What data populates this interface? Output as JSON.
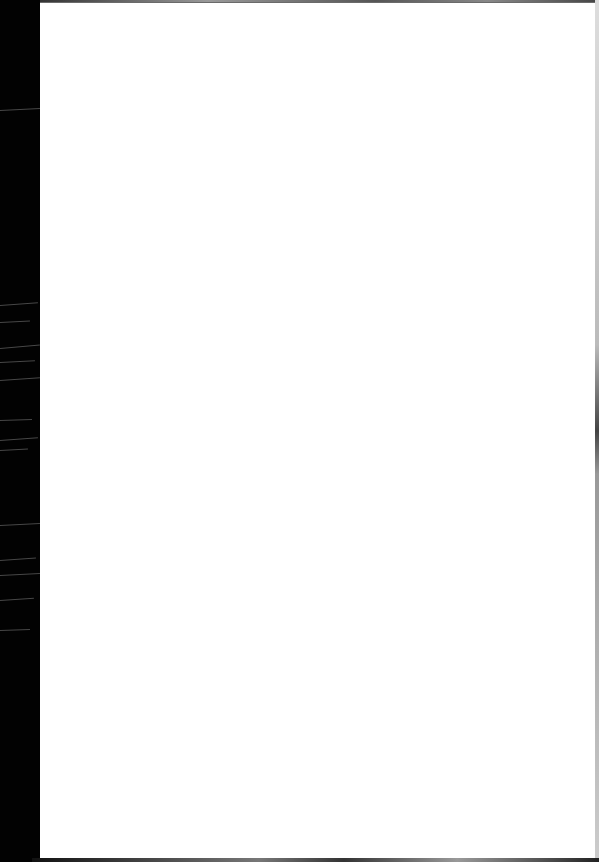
{
  "document": {
    "type": "scanned-page",
    "content": "",
    "colors": {
      "page": "#ffffff",
      "scanner_bed": "#000000"
    }
  }
}
